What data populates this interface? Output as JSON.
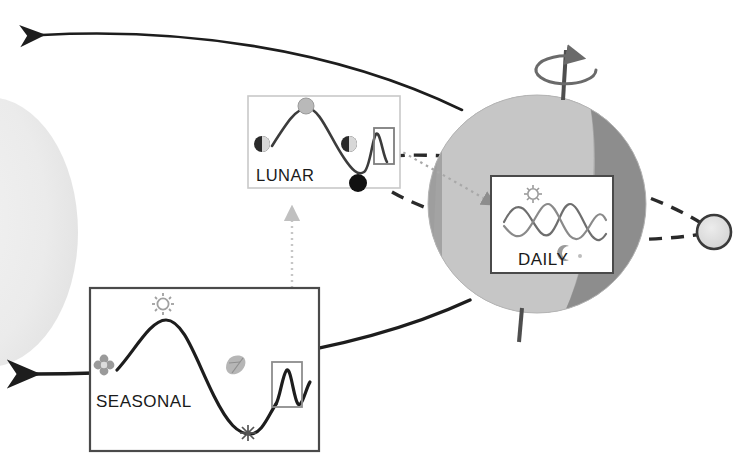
{
  "figure": {
    "background_color": "#ffffff"
  },
  "colors": {
    "line_dark": "#1d1d1d",
    "globe_day": "#c3c3c3",
    "globe_limb": "#9d9d9d",
    "globe_night": "#8f8f8f",
    "sun_fill": "#ececec",
    "moon_fill": "#dedede",
    "moon_stroke": "#3a3a3a",
    "icon_gray": "#9a9a9a",
    "panel_border_light": "#c9c9c9",
    "panel_border_dark": "#4a4a4a",
    "dotted_guide": "#b8b8b8",
    "wave_lunar": "#3c3c3c",
    "wave_seasonal": "#1d1d1d",
    "wave_daily": "#6e6e6e"
  },
  "panels": {
    "lunar": {
      "label": "LUNAR",
      "border_color": "#c9c9c9",
      "rect": {
        "x": 248,
        "y": 96,
        "w": 152,
        "h": 92
      },
      "wave": {
        "type": "line",
        "description": "single lunar-month oscillation with moon-phase markers",
        "cycles": 1
      },
      "markers": [
        {
          "name": "first-quarter-moon",
          "phase": "half",
          "x": 262,
          "y": 144
        },
        {
          "name": "full-moon",
          "phase": "full",
          "x": 306,
          "y": 106
        },
        {
          "name": "last-quarter-moon",
          "phase": "half",
          "x": 349,
          "y": 144
        },
        {
          "name": "new-moon",
          "phase": "new",
          "x": 358,
          "y": 183
        }
      ],
      "zoom_box": {
        "x": 374,
        "y": 128,
        "w": 20,
        "h": 35
      }
    },
    "daily": {
      "label": "DAILY",
      "border_color": "#4a4a4a",
      "rect": {
        "x": 491,
        "y": 176,
        "w": 122,
        "h": 97
      },
      "wave": {
        "type": "line",
        "description": "two interleaved circadian sine waves",
        "cycles": 2,
        "series_count": 2
      },
      "markers": [
        {
          "name": "sun-icon",
          "label": "day",
          "x": 533,
          "y": 194
        },
        {
          "name": "moon-crescent-icon",
          "label": "night",
          "x": 566,
          "y": 253
        }
      ]
    },
    "seasonal": {
      "label": "SEASONAL",
      "border_color": "#4a4a4a",
      "rect": {
        "x": 90,
        "y": 288,
        "w": 229,
        "h": 163
      },
      "wave": {
        "type": "line",
        "description": "annual oscillation with season icons",
        "cycles": 1
      },
      "markers": [
        {
          "name": "flower-icon",
          "label": "spring",
          "x": 104,
          "y": 365
        },
        {
          "name": "sun-icon",
          "label": "summer",
          "x": 163,
          "y": 304
        },
        {
          "name": "leaf-icon",
          "label": "autumn",
          "x": 233,
          "y": 364
        },
        {
          "name": "snowflake-icon",
          "label": "winter",
          "x": 248,
          "y": 433
        }
      ],
      "zoom_box": {
        "x": 272,
        "y": 362,
        "w": 30,
        "h": 44
      }
    }
  },
  "scene": {
    "earth": {
      "name": "earth-globe",
      "center": {
        "x": 537,
        "y": 204
      },
      "radius": 109,
      "terminator": "day side light, night side dark gray",
      "rotation_arrow": {
        "name": "rotation-arrow",
        "label": "axial rotation",
        "x": 566,
        "y": 70
      },
      "axis": {
        "name": "polar-axis",
        "top": {
          "x": 565,
          "y": 48
        },
        "bottom": {
          "x": 521,
          "y": 340
        }
      }
    },
    "moon": {
      "name": "moon-body",
      "center": {
        "x": 714,
        "y": 232
      },
      "radius": 17
    },
    "sun": {
      "name": "sun-body",
      "description": "partial solar disc at left edge",
      "center": {
        "x": -40,
        "y": 232
      },
      "radius": 107
    },
    "orbit_paths": [
      {
        "name": "earth-orbit-outbound",
        "style": "solid",
        "arrow": "left",
        "label": "orbital motion around the sun"
      },
      {
        "name": "earth-orbit-inbound",
        "style": "solid",
        "arrow": "right",
        "label": "orbital motion around the sun"
      },
      {
        "name": "moon-orbit",
        "style": "dashed",
        "label": "lunar orbit around earth"
      }
    ],
    "callouts": [
      {
        "name": "callout-seasonal-to-lunar",
        "style": "dotted",
        "from": "seasonal",
        "to": "lunar",
        "direction": "up"
      },
      {
        "name": "callout-lunar-to-daily",
        "style": "dotted",
        "from": "lunar",
        "to": "daily",
        "direction": "right-down"
      }
    ]
  }
}
